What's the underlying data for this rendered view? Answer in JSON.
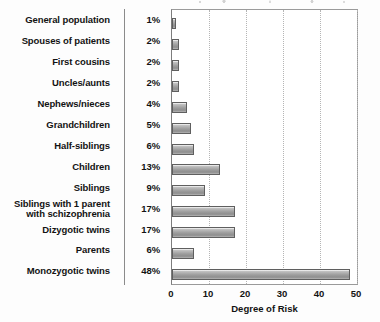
{
  "chart_data": {
    "type": "bar",
    "orientation": "horizontal",
    "title": "",
    "xlabel": "Degree of Risk",
    "ylabel": "",
    "xlim": [
      0,
      50
    ],
    "xticks": [
      0,
      10,
      20,
      30,
      40,
      50
    ],
    "grid": "vertical dotted gridlines at each x tick",
    "legend": "none",
    "value_label_suffix": "%",
    "categories": [
      "General population",
      "Spouses of patients",
      "First cousins",
      "Uncles/aunts",
      "Nephews/nieces",
      "Grandchildren",
      "Half-siblings",
      "Children",
      "Siblings",
      "Siblings with 1 parent\nwith schizophrenia",
      "Dizygotic twins",
      "Parents",
      "Monozygotic twins"
    ],
    "values": [
      1,
      2,
      2,
      2,
      4,
      5,
      6,
      13,
      9,
      17,
      17,
      6,
      48
    ],
    "value_labels": [
      "1%",
      "2%",
      "2%",
      "2%",
      "4%",
      "5%",
      "6%",
      "13%",
      "9%",
      "17%",
      "17%",
      "6%",
      "48%"
    ],
    "colors": {
      "bar_fill": "#9c9c9c",
      "bar_fill_highlight": "#d8d8d8",
      "bar_outline": "#5f5f5f",
      "plot_border": "#9a9a9a",
      "gridline": "#b5b5b5",
      "text": "#131313",
      "divider": "#8b8b8b",
      "background": "#ffffff"
    }
  }
}
